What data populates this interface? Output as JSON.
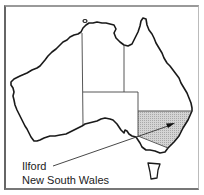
{
  "map": {
    "title": "Australia",
    "highlighted_region": "New South Wales",
    "colors": {
      "coast": "#1a1a1a",
      "borders": "#444444",
      "highlight_fill": "#c8c8c8",
      "background": "#ffffff"
    },
    "regions": [
      {
        "name": "Western Australia",
        "highlighted": false
      },
      {
        "name": "Northern Territory",
        "highlighted": false
      },
      {
        "name": "South Australia",
        "highlighted": false
      },
      {
        "name": "Queensland",
        "highlighted": false
      },
      {
        "name": "New South Wales",
        "highlighted": true
      },
      {
        "name": "Victoria",
        "highlighted": false
      },
      {
        "name": "Tasmania",
        "highlighted": false
      }
    ]
  },
  "callout": {
    "city": "Ilford",
    "state": "New South Wales"
  }
}
